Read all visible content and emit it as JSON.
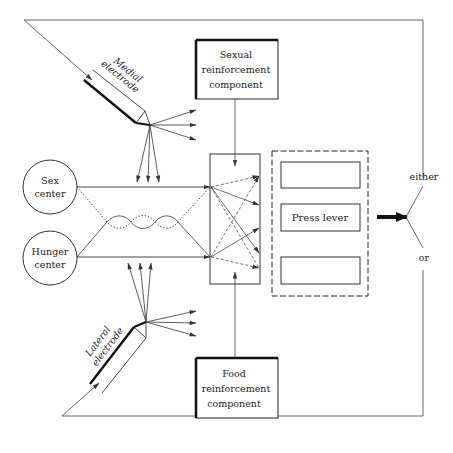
{
  "diagram": {
    "title": "",
    "nodes": {
      "medial_electrode": {
        "line1": "Medial",
        "line2": "electrode"
      },
      "lateral_electrode": {
        "line1": "Lateral",
        "line2": "electrode"
      },
      "sexual_component": {
        "line1": "Sexual",
        "line2": "reinforcement",
        "line3": "component"
      },
      "food_component": {
        "line1": "Food",
        "line2": "reinforcement",
        "line3": "component"
      },
      "sex_center": {
        "line1": "Sex",
        "line2": "center"
      },
      "hunger_center": {
        "line1": "Hunger",
        "line2": "center"
      },
      "response_panel": {
        "top_slot": "",
        "middle_slot": "Press lever",
        "bottom_slot": ""
      },
      "output_choice": {
        "either": "either",
        "or": "or"
      }
    },
    "colors": {
      "stroke": "#333333",
      "text": "#222222",
      "background": "#ffffff"
    }
  }
}
